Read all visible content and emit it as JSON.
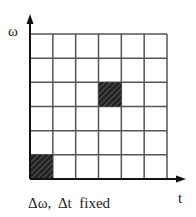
{
  "diagram": {
    "y_axis_label": "ω",
    "x_axis_label": "t",
    "caption": "Δω,  Δt  fixed",
    "grid": {
      "columns": 6,
      "rows": 6,
      "shaded_cells": [
        {
          "col": 0,
          "row_from_bottom": 0
        },
        {
          "col": 3,
          "row_from_bottom": 3
        }
      ]
    },
    "colors": {
      "line": "#555555",
      "axis": "#111111",
      "shade": "#2a2a2a"
    }
  }
}
